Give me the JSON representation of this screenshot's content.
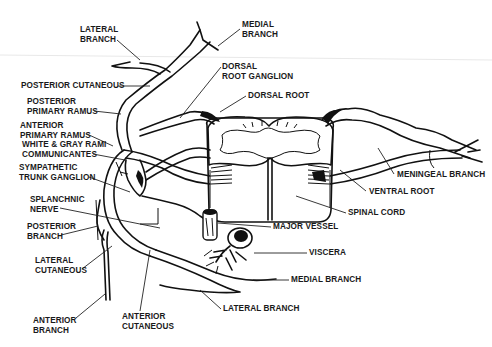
{
  "diagram": {
    "labels": [
      {
        "id": "lateral-branch-top",
        "text": "LATERAL\nBRANCH",
        "x": 80,
        "y": 25
      },
      {
        "id": "medial-branch-top",
        "text": "MEDIAL\nBRANCH",
        "x": 242,
        "y": 20
      },
      {
        "id": "dorsal-root-ganglion",
        "text": "DORSAL\nROOT GANGLION",
        "x": 222,
        "y": 62
      },
      {
        "id": "posterior-cutaneous",
        "text": "POSTERIOR CUTANEOUS",
        "x": 21,
        "y": 81
      },
      {
        "id": "dorsal-root",
        "text": "DORSAL ROOT",
        "x": 248,
        "y": 91
      },
      {
        "id": "posterior-primary-ramus",
        "text": "POSTERIOR\nPRIMARY RAMUS",
        "x": 27,
        "y": 97
      },
      {
        "id": "anterior-primary-ramus",
        "text": "ANTERIOR\nPRIMARY RAMUS",
        "x": 20,
        "y": 121
      },
      {
        "id": "white-gray-rami",
        "text": "WHITE & GRAY RAMI\nCOMMUNICANTES",
        "x": 22,
        "y": 140
      },
      {
        "id": "sympathetic-trunk-ganglion",
        "text": "SYMPATHETIC\nTRUNK GANGLION",
        "x": 19,
        "y": 163
      },
      {
        "id": "meningeal-branch",
        "text": "MENINGEAL BRANCH",
        "x": 397,
        "y": 170
      },
      {
        "id": "ventral-root",
        "text": "VENTRAL ROOT",
        "x": 369,
        "y": 187
      },
      {
        "id": "splanchnic-nerve",
        "text": "SPLANCHNIC\nNERVE",
        "x": 30,
        "y": 195
      },
      {
        "id": "spinal-cord",
        "text": "SPINAL CORD",
        "x": 348,
        "y": 208
      },
      {
        "id": "posterior-branch",
        "text": "POSTERIOR\nBRANCH",
        "x": 27,
        "y": 222
      },
      {
        "id": "major-vessel",
        "text": "MAJOR VESSEL",
        "x": 273,
        "y": 222
      },
      {
        "id": "viscera",
        "text": "VISCERA",
        "x": 309,
        "y": 248
      },
      {
        "id": "lateral-cutaneous",
        "text": "LATERAL\nCUTANEOUS",
        "x": 35,
        "y": 256
      },
      {
        "id": "medial-branch-bottom",
        "text": "MEDIAL BRANCH",
        "x": 291,
        "y": 275
      },
      {
        "id": "lateral-branch-bottom",
        "text": "LATERAL BRANCH",
        "x": 223,
        "y": 304
      },
      {
        "id": "anterior-branch",
        "text": "ANTERIOR\nBRANCH",
        "x": 33,
        "y": 316
      },
      {
        "id": "anterior-cutaneous",
        "text": "ANTERIOR\nCUTANEOUS",
        "x": 122,
        "y": 312
      }
    ],
    "colors": {
      "ink": "#111111",
      "background": "#ffffff"
    }
  }
}
